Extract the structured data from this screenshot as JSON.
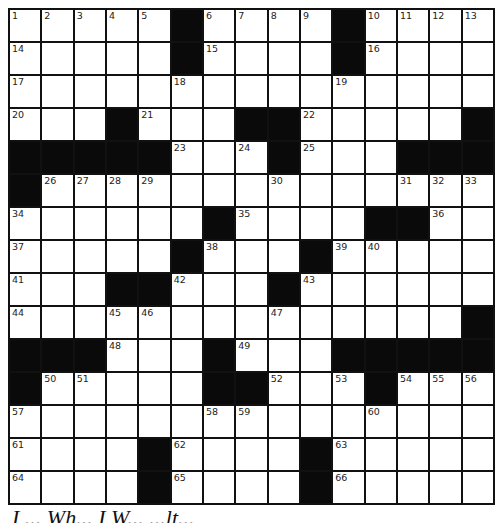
{
  "puzzle": {
    "size": 15,
    "black": [
      [
        0,
        5
      ],
      [
        0,
        10
      ],
      [
        1,
        5
      ],
      [
        1,
        10
      ],
      [
        3,
        3
      ],
      [
        3,
        7
      ],
      [
        3,
        8
      ],
      [
        3,
        14
      ],
      [
        4,
        0
      ],
      [
        4,
        1
      ],
      [
        4,
        2
      ],
      [
        4,
        3
      ],
      [
        4,
        4
      ],
      [
        4,
        8
      ],
      [
        4,
        12
      ],
      [
        4,
        13
      ],
      [
        4,
        14
      ],
      [
        5,
        0
      ],
      [
        6,
        6
      ],
      [
        6,
        11
      ],
      [
        6,
        12
      ],
      [
        7,
        5
      ],
      [
        7,
        9
      ],
      [
        8,
        3
      ],
      [
        8,
        4
      ],
      [
        8,
        8
      ],
      [
        9,
        14
      ],
      [
        10,
        0
      ],
      [
        10,
        1
      ],
      [
        10,
        2
      ],
      [
        10,
        6
      ],
      [
        10,
        10
      ],
      [
        10,
        11
      ],
      [
        10,
        12
      ],
      [
        10,
        13
      ],
      [
        10,
        14
      ],
      [
        11,
        0
      ],
      [
        11,
        6
      ],
      [
        11,
        7
      ],
      [
        11,
        11
      ],
      [
        13,
        4
      ],
      [
        13,
        9
      ],
      [
        14,
        4
      ],
      [
        14,
        9
      ]
    ],
    "numbers": {
      "0,0": "1",
      "0,1": "2",
      "0,2": "3",
      "0,3": "4",
      "0,4": "5",
      "0,6": "6",
      "0,7": "7",
      "0,8": "8",
      "0,9": "9",
      "0,11": "10",
      "0,12": "11",
      "0,13": "12",
      "0,14": "13",
      "1,0": "14",
      "1,6": "15",
      "1,11": "16",
      "2,0": "17",
      "2,5": "18",
      "2,10": "19",
      "3,0": "20",
      "3,4": "21",
      "3,9": "22",
      "4,5": "23",
      "4,7": "24",
      "4,9": "25",
      "5,1": "26",
      "5,2": "27",
      "5,3": "28",
      "5,4": "29",
      "5,8": "30",
      "5,12": "31",
      "5,13": "32",
      "5,14": "33",
      "6,0": "34",
      "6,7": "35",
      "6,13": "36",
      "7,0": "37",
      "7,6": "38",
      "7,10": "39",
      "7,11": "40",
      "8,0": "41",
      "8,5": "42",
      "8,9": "43",
      "9,0": "44",
      "9,3": "45",
      "9,4": "46",
      "9,8": "47",
      "10,3": "48",
      "10,7": "49",
      "11,1": "50",
      "11,2": "51",
      "11,8": "52",
      "11,10": "53",
      "11,12": "54",
      "11,13": "55",
      "11,14": "56",
      "12,0": "57",
      "12,6": "58",
      "12,7": "59",
      "12,11": "60",
      "13,0": "61",
      "13,5": "62",
      "13,10": "63",
      "14,0": "64",
      "14,5": "65",
      "14,10": "66"
    }
  },
  "caption": "I ... Wh... I W... ...lt..."
}
